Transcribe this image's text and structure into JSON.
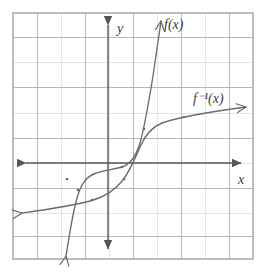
{
  "figure": {
    "background_color": "#ffffff",
    "grid": {
      "minor_color": "#e2e2e6",
      "major_color": "#a8a8ae",
      "border_color": "#b8b8be",
      "cell_size_px": 24,
      "left_px": 13,
      "top_px": 13,
      "right_px": 253,
      "bottom_px": 259,
      "columns": 10,
      "rows": 10,
      "visible": true
    },
    "axes": {
      "color": "#555559",
      "origin_px": {
        "x": 108,
        "y": 163
      },
      "x_axis": {
        "label": "x",
        "label_px": {
          "x": 240,
          "y": 182
        },
        "start_px": {
          "x": 20,
          "y": 163
        },
        "end_px": {
          "x": 248,
          "y": 163
        },
        "arrow_left": true,
        "arrow_right": true
      },
      "y_axis": {
        "label": "y",
        "label_px": {
          "x": 117,
          "y": 30
        },
        "start_px": {
          "x": 108,
          "y": 18
        },
        "end_px": {
          "x": 108,
          "y": 256
        },
        "arrow_up": true,
        "arrow_down": true
      }
    },
    "curves": [
      {
        "name": "f",
        "label": "f(x)",
        "label_px": {
          "x": 166,
          "y": 27
        },
        "color": "#6a6a70",
        "stroke_width": 1.3,
        "description": "Steep cubic-like increasing curve with a flat inflection near the origin region",
        "arrow_start": true,
        "arrow_end": true,
        "points_px": [
          [
            66,
            256
          ],
          [
            70,
            230
          ],
          [
            74,
            206
          ],
          [
            78,
            190
          ],
          [
            83,
            180
          ],
          [
            90,
            175
          ],
          [
            100,
            172
          ],
          [
            112,
            170
          ],
          [
            124,
            166
          ],
          [
            133,
            158
          ],
          [
            139,
            146
          ],
          [
            145,
            128
          ],
          [
            150,
            104
          ],
          [
            154,
            80
          ],
          [
            158,
            50
          ],
          [
            161,
            21
          ]
        ]
      },
      {
        "name": "f_inverse",
        "label": "f⁻¹(x)",
        "label_px": {
          "x": 196,
          "y": 101
        },
        "color": "#6a6a70",
        "stroke_width": 1.3,
        "description": "Reflection of f across the line y = x; shallow increasing curve",
        "arrow_start": true,
        "arrow_end": true,
        "points_px": [
          [
            22,
            213
          ],
          [
            48,
            209
          ],
          [
            72,
            205
          ],
          [
            90,
            201
          ],
          [
            104,
            196
          ],
          [
            116,
            189
          ],
          [
            124,
            180
          ],
          [
            130,
            170
          ],
          [
            136,
            158
          ],
          [
            142,
            143
          ],
          [
            148,
            131
          ],
          [
            158,
            124
          ],
          [
            172,
            120
          ],
          [
            190,
            116
          ],
          [
            212,
            112
          ],
          [
            246,
            107
          ]
        ]
      }
    ],
    "marks": {
      "description": "Small tick dots where the two curves cross grid intersections",
      "dots_px": [
        [
          78,
          190
        ],
        [
          66,
          179
        ],
        [
          124,
          166
        ],
        [
          90,
          201
        ],
        [
          124,
          180
        ],
        [
          145,
          128
        ],
        [
          183,
          117
        ]
      ],
      "color": "#6a6a70"
    }
  }
}
